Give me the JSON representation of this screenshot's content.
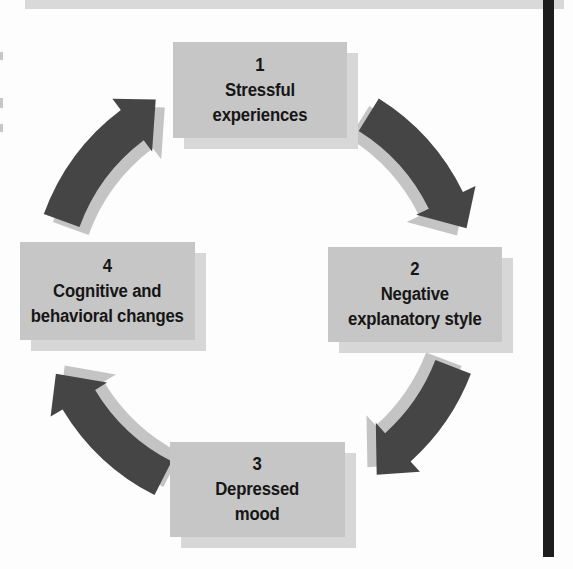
{
  "diagram": {
    "type": "cycle",
    "direction": "clockwise",
    "nodes": [
      {
        "number": "1",
        "lines": [
          "Stressful",
          "experiences"
        ],
        "position": "top"
      },
      {
        "number": "2",
        "lines": [
          "Negative",
          "explanatory style"
        ],
        "position": "right"
      },
      {
        "number": "3",
        "lines": [
          "Depressed",
          "mood"
        ],
        "position": "bottom"
      },
      {
        "number": "4",
        "lines": [
          "Cognitive and",
          "behavioral changes"
        ],
        "position": "left"
      }
    ],
    "edges": [
      {
        "from": "1",
        "to": "2"
      },
      {
        "from": "2",
        "to": "3"
      },
      {
        "from": "3",
        "to": "4"
      },
      {
        "from": "4",
        "to": "1"
      }
    ],
    "colors": {
      "background": "#fdfdfd",
      "box_fill": "#c6c6c6",
      "box_shadow": "#d7d7d7",
      "arrow": "#454545",
      "arrow_shadow": "#c4c4c4",
      "top_bar": "#d9d9d9",
      "rule": "#1d1d1d",
      "text": "#161616"
    }
  }
}
